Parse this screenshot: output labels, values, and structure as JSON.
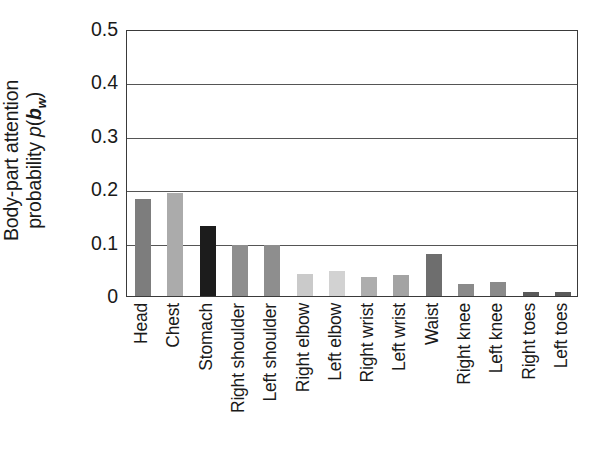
{
  "chart_data": {
    "type": "bar",
    "title": "",
    "xlabel": "",
    "ylabel": "Body-part attention probability p(b_w)",
    "ylabel_line1": "Body-part attention",
    "ylabel_line2_prefix": "probability ",
    "ylabel_line2_p": "p",
    "ylabel_line2_open": "(",
    "ylabel_line2_b": "b",
    "ylabel_line2_sub": "w",
    "ylabel_line2_close": ")",
    "ylim": [
      0,
      0.5
    ],
    "ytick_labels": [
      "0.5",
      "0.4",
      "0.3",
      "0.2",
      "0.1",
      "0"
    ],
    "ytick_values": [
      0.5,
      0.4,
      0.3,
      0.2,
      0.1,
      0
    ],
    "grid": true,
    "grid_axis": "y",
    "legend": "none",
    "categories": [
      "Head",
      "Chest",
      "Stomach",
      "Right shoulder",
      "Left shoulder",
      "Right elbow",
      "Left elbow",
      "Right wrist",
      "Left wrist",
      "Waist",
      "Right knee",
      "Left knee",
      "Right toes",
      "Left toes"
    ],
    "values": [
      0.182,
      0.192,
      0.131,
      0.095,
      0.096,
      0.042,
      0.047,
      0.036,
      0.04,
      0.078,
      0.022,
      0.026,
      0.007,
      0.007
    ],
    "bar_colors": [
      "#7d7d7d",
      "#ababab",
      "#1c1c1c",
      "#8e8e8e",
      "#8e8e8e",
      "#cacaca",
      "#d2d2d2",
      "#adadad",
      "#a3a3a3",
      "#6e6e6e",
      "#8a8a8a",
      "#8a8a8a",
      "#5a5a5a",
      "#5a5a5a"
    ],
    "axis_color": "#3a3a3a",
    "grid_color": "#555555",
    "background_color": "#ffffff"
  }
}
